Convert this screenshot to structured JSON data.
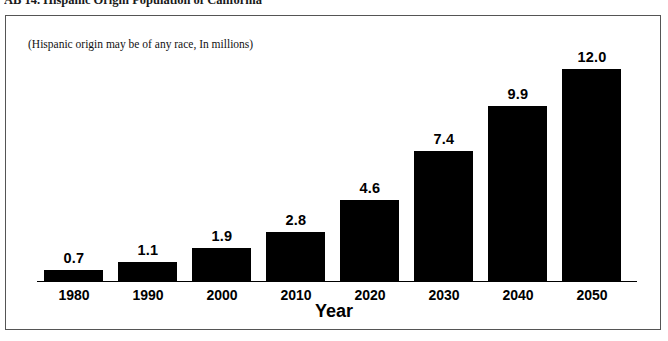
{
  "document": {
    "title": "AB 14. Hispanic Origin Population of California"
  },
  "chart": {
    "subtitle": "(Hispanic origin may be of any race, In millions)",
    "axis_title": "Year"
  },
  "chart_data": {
    "type": "bar",
    "title": "AB 14. Hispanic Origin Population of California",
    "subtitle": "(Hispanic origin may be of any race, In millions)",
    "xlabel": "Year",
    "ylabel": "",
    "ylim": [
      0,
      13.2
    ],
    "grid": false,
    "legend": "none",
    "bar_color": "#000000",
    "categories": [
      "1980",
      "1990",
      "2000",
      "2010",
      "2020",
      "2030",
      "2040",
      "2050"
    ],
    "values": [
      0.7,
      1.1,
      1.9,
      2.8,
      4.6,
      7.4,
      9.9,
      12.0
    ],
    "value_labels": [
      "0.7",
      "1.1",
      "1.9",
      "2.8",
      "4.6",
      "7.4",
      "9.9",
      "12.0"
    ]
  }
}
